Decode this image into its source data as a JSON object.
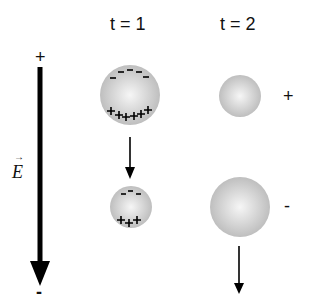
{
  "diagram": {
    "column_labels": [
      "t = 1",
      "t = 2"
    ],
    "field": {
      "label": "E",
      "vector_arrow": "→",
      "top_sign": "+",
      "bottom_sign": "-"
    },
    "t1": {
      "upper_sphere": {
        "top_charges": "- - - - -",
        "bottom_charges": "+ + + + + +"
      },
      "lower_sphere": {
        "top_charges": "- - -",
        "bottom_charges": "+ + +"
      }
    },
    "t2": {
      "upper_sphere": {
        "net_charge": "+"
      },
      "lower_sphere": {
        "net_charge": "-"
      }
    },
    "colors": {
      "sphere_light": "#f4f4f4",
      "sphere_dark": "#bdbdbd",
      "ink": "#000000"
    }
  }
}
